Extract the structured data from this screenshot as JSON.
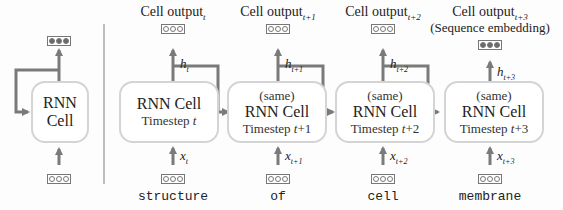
{
  "left_panel": {
    "cell": {
      "line1": "RNN",
      "line2": "Cell"
    },
    "output_vector": "filled",
    "input_vector": "empty"
  },
  "timesteps": [
    {
      "output_label": "Cell output",
      "output_sub": "t",
      "extra_label": "",
      "same": "",
      "name": "RNN Cell",
      "timestep_prefix": "Timestep ",
      "timestep_var": "t",
      "timestep_suffix": "",
      "h_var": "h",
      "h_sub": "t",
      "x_var": "x",
      "x_sub": "t",
      "word": "structure",
      "output_vector": "empty"
    },
    {
      "output_label": "Cell output",
      "output_sub": "t+1",
      "extra_label": "",
      "same": "(same)",
      "name": "RNN Cell",
      "timestep_prefix": "Timestep ",
      "timestep_var": "t",
      "timestep_suffix": "+1",
      "h_var": "h",
      "h_sub": "t+1",
      "x_var": "x",
      "x_sub": "t+1",
      "word": "of",
      "output_vector": "empty"
    },
    {
      "output_label": "Cell output",
      "output_sub": "t+2",
      "extra_label": "",
      "same": "(same)",
      "name": "RNN Cell",
      "timestep_prefix": "Timestep ",
      "timestep_var": "t",
      "timestep_suffix": "+2",
      "h_var": "h",
      "h_sub": "t+2",
      "x_var": "x",
      "x_sub": "t+2",
      "word": "cell",
      "output_vector": "empty"
    },
    {
      "output_label": "Cell output",
      "output_sub": "t+3",
      "extra_label": "(Sequence embedding)",
      "same": "(same)",
      "name": "RNN Cell",
      "timestep_prefix": "Timestep ",
      "timestep_var": "t",
      "timestep_suffix": "+3",
      "h_var": "h",
      "h_sub": "t+3",
      "x_var": "x",
      "x_sub": "t+3",
      "word": "membrane",
      "output_vector": "filled"
    }
  ],
  "colors": {
    "arrow": "#7a7a7a",
    "cell_border": "#d4d4d4",
    "divider": "#bdbdbd"
  }
}
